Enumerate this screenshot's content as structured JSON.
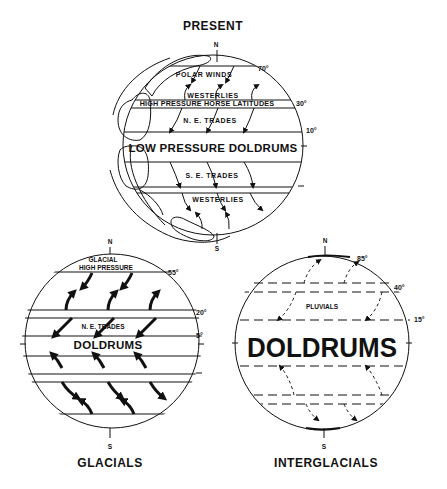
{
  "figure": {
    "present": {
      "title": "PRESENT",
      "north": "N",
      "south": "S",
      "bands": [
        {
          "label": "POLAR WINDS"
        },
        {
          "label": "WESTERLIES"
        },
        {
          "label": "HIGH PRESSURE HORSE LATITUDES"
        },
        {
          "label": "N. E.   TRADES"
        },
        {
          "label": "LOW PRESSURE  DOLDRUMS"
        },
        {
          "label": "S. E.   TRADES"
        },
        {
          "label": "WESTERLIES"
        }
      ],
      "latitudes": [
        "70°",
        "30°",
        "10°"
      ]
    },
    "glacials": {
      "title": "GLACIALS",
      "north": "N",
      "south": "S",
      "bands": [
        {
          "label": "GLACIAL"
        },
        {
          "label": "HIGH PRESSURE"
        },
        {
          "label": "N. E.   TRADES"
        },
        {
          "label": "DOLDRUMS"
        }
      ],
      "latitudes": [
        "55°",
        "20°",
        "5°"
      ]
    },
    "interglacials": {
      "title": "INTERGLACIALS",
      "north": "N",
      "south": "S",
      "bands": [
        {
          "label": "PLUVIALS"
        },
        {
          "label": "DOLDRUMS"
        }
      ],
      "latitudes": [
        "85°",
        "40°",
        "15°"
      ]
    }
  },
  "colors": {
    "ink": "#111111",
    "background": "#ffffff"
  }
}
